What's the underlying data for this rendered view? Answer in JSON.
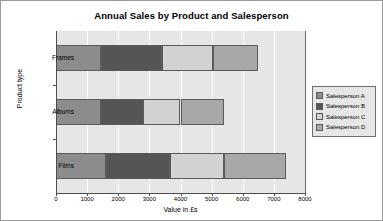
{
  "chart_data": {
    "type": "bar",
    "orientation": "horizontal",
    "stacked": true,
    "title": "Annual Sales by Product and Salesperson",
    "xlabel": "Value in £s",
    "ylabel": "Product type",
    "categories": [
      "Frames",
      "Albums",
      "Films"
    ],
    "series": [
      {
        "name": "Salesperson A",
        "color": "#8c8c8c",
        "values": [
          1450,
          1450,
          1600
        ]
      },
      {
        "name": "Salesperson B",
        "color": "#555555",
        "values": [
          1950,
          1350,
          2050
        ]
      },
      {
        "name": "Salesperson C",
        "color": "#d2d2d2",
        "values": [
          1650,
          1200,
          1750
        ]
      },
      {
        "name": "Salesperson D",
        "color": "#a8a8a8",
        "values": [
          1450,
          1400,
          2000
        ]
      }
    ],
    "totals": [
      6500,
      5400,
      7400
    ],
    "xlim": [
      0,
      8000
    ],
    "xticks": [
      0,
      1000,
      2000,
      3000,
      4000,
      5000,
      6000,
      7000,
      8000
    ],
    "xtick_labels": [
      "0",
      "1000",
      "2000",
      "3000",
      "4000",
      "5000",
      "6000",
      "7000",
      "8000"
    ],
    "grid": "vertical",
    "legend_position": "right",
    "plot_background": "#e6e6e6",
    "figure_background": "#ffffff"
  }
}
